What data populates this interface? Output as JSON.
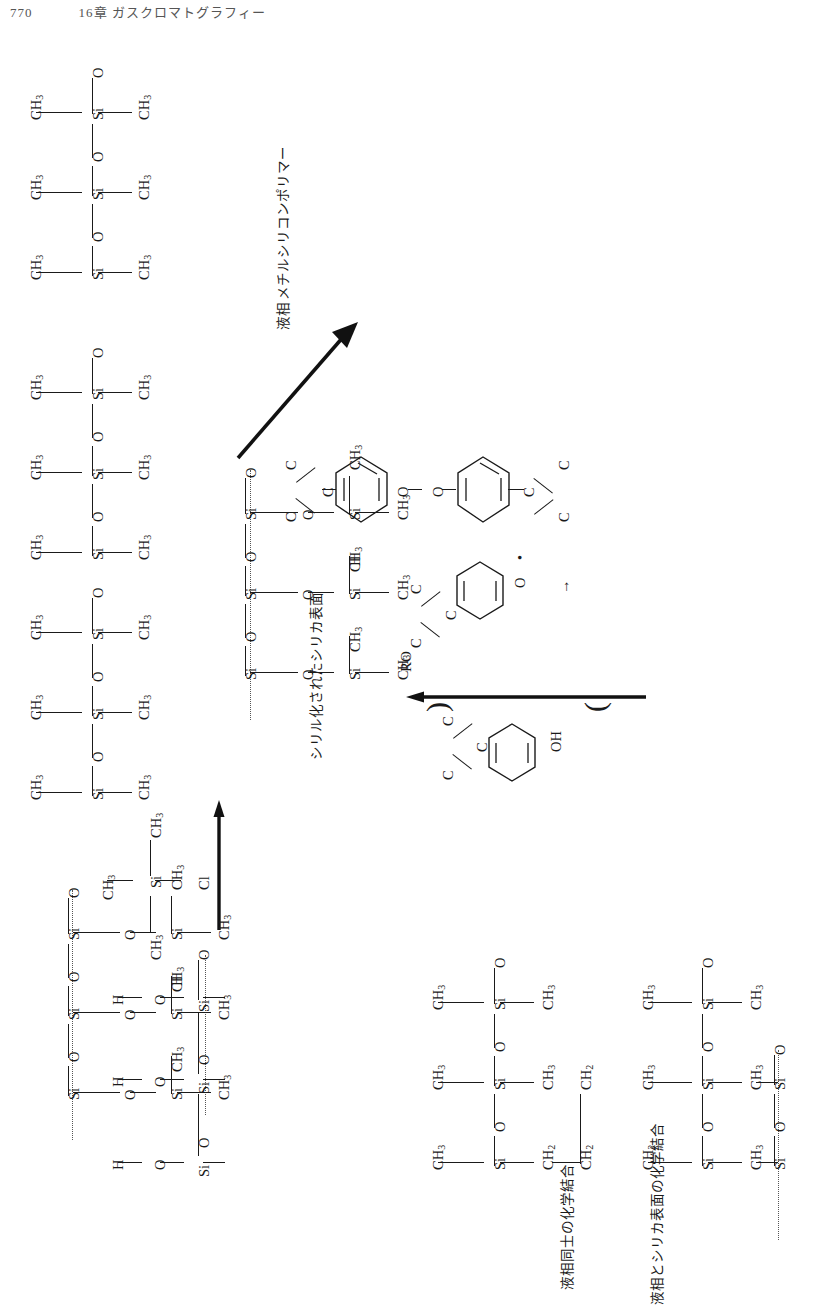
{
  "page": {
    "number": "770",
    "running_head": "16章 ガスクロマトグラフィー",
    "orientation": "rotated-90-ccw",
    "background": "#ffffff",
    "ink": "#1a1a1a"
  },
  "labels": {
    "liquid_phase": "液相",
    "methylsilicone_polymer": "メチルシリコンポリマー",
    "silylated_silica_surface": "シリル化されたシリカ表面",
    "chemical_bond_between_liquid_phases": "液相同士の化学結合",
    "chemical_bond_liquid_and_silica": "液相とシリカ表面の化学結合",
    "ro_radical": "RO",
    "hydroxyl": "OH"
  },
  "atoms": {
    "ch3": "CH3",
    "ch2": "CH2",
    "si": "Si",
    "o": "O",
    "h": "H",
    "cl": "Cl",
    "c": "C"
  },
  "schemes": [
    {
      "id": "silica-surface",
      "caption": "",
      "description": "silanol-terminated silica surface",
      "rows": [
        "H—O—Si—",
        "H—O—Si—",
        "H—O—Si—O—"
      ]
    },
    {
      "id": "silylating-reagent",
      "description": "chlorodimethylsilane reagent over reaction arrow",
      "formula": [
        "CH3",
        "Si",
        "Cl",
        "CH3"
      ]
    },
    {
      "id": "silylated-silica",
      "caption": "シリル化されたシリカ表面",
      "description": "silylated silica surface after reaction"
    },
    {
      "id": "methylsilicone-polymer",
      "caption": "メチルシリコンポリマー",
      "secondary_caption": "液相",
      "description": "methyl silicone polymer liquid phase"
    },
    {
      "id": "peroxide-initiator",
      "description": "dicumyl peroxide homolysis producing RO radical",
      "arrow_label": "RO",
      "byproduct_label": "OH"
    },
    {
      "id": "crosslinked-product",
      "captions": [
        "液相同士の化学結合",
        "液相とシリカ表面の化学結合"
      ],
      "description": "crosslinked silicone bonded to silica surface"
    }
  ]
}
